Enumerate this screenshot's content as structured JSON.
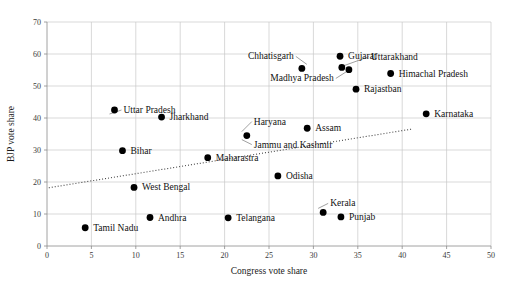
{
  "chart_data": {
    "type": "scatter",
    "title": "",
    "xlabel": "Congress vote share",
    "ylabel": "BJP vote share",
    "xlim": [
      0,
      50
    ],
    "ylim": [
      0,
      70
    ],
    "xticks": [
      0,
      5,
      10,
      15,
      20,
      25,
      30,
      35,
      40,
      45,
      50
    ],
    "yticks": [
      0,
      10,
      20,
      30,
      40,
      50,
      60,
      70
    ],
    "grid": true,
    "legend": "none",
    "marker_color": "#000000",
    "trendline": {
      "visible": true,
      "style": "dotted",
      "x_start": 0.2,
      "y_start": 18.2,
      "x_end": 41.0,
      "y_end": 36.5
    },
    "points": [
      {
        "label": "Uttar Pradesh",
        "x": 7.6,
        "y": 42.5,
        "label_dx": 9,
        "label_dy": 3,
        "leader": true
      },
      {
        "label": "Jharkhand",
        "x": 12.9,
        "y": 40.3,
        "label_dx": 8,
        "label_dy": 3,
        "leader": false
      },
      {
        "label": "Chhatisgarh",
        "x": 28.7,
        "y": 55.5,
        "label_dx": -8,
        "label_dy": -9,
        "leader": true
      },
      {
        "label": "Gujarat",
        "x": 33.0,
        "y": 59.3,
        "label_dx": 8,
        "label_dy": 3,
        "leader": false
      },
      {
        "label": "Uttarakhand",
        "x": 34.0,
        "y": 55.1,
        "label_dx": 22,
        "label_dy": -10,
        "leader": true
      },
      {
        "label": "Madhya Pradesh",
        "x": 33.2,
        "y": 55.8,
        "label_dx": -8,
        "label_dy": 14,
        "leader": true
      },
      {
        "label": "Himachal Pradesh",
        "x": 38.7,
        "y": 53.9,
        "label_dx": 8,
        "label_dy": 3,
        "leader": false
      },
      {
        "label": "Rajastban",
        "x": 34.8,
        "y": 49.0,
        "label_dx": 8,
        "label_dy": 3,
        "leader": false
      },
      {
        "label": "Karnataka",
        "x": 42.7,
        "y": 41.3,
        "label_dx": 8,
        "label_dy": 3,
        "leader": false
      },
      {
        "label": "Haryana",
        "x": 22.5,
        "y": 34.5,
        "label_dx": 7,
        "label_dy": -11,
        "leader": true
      },
      {
        "label": "Jammu and Kashmir",
        "x": 22.5,
        "y": 34.5,
        "label_dx": 7,
        "label_dy": 12,
        "leader": true
      },
      {
        "label": "Assam",
        "x": 29.3,
        "y": 36.8,
        "label_dx": 8,
        "label_dy": 3,
        "leader": false
      },
      {
        "label": "Bihar",
        "x": 8.5,
        "y": 29.8,
        "label_dx": 8,
        "label_dy": 3,
        "leader": false
      },
      {
        "label": "Maharastra",
        "x": 18.1,
        "y": 27.6,
        "label_dx": 8,
        "label_dy": 3,
        "leader": false
      },
      {
        "label": "Odisha",
        "x": 26.0,
        "y": 21.9,
        "label_dx": 8,
        "label_dy": 3,
        "leader": false
      },
      {
        "label": "West Bengal",
        "x": 9.8,
        "y": 18.3,
        "label_dx": 8,
        "label_dy": 3,
        "leader": false
      },
      {
        "label": "Andhra",
        "x": 11.6,
        "y": 8.9,
        "label_dx": 8,
        "label_dy": 3,
        "leader": false
      },
      {
        "label": "Telangana",
        "x": 20.4,
        "y": 8.8,
        "label_dx": 8,
        "label_dy": 3,
        "leader": false
      },
      {
        "label": "Kerala",
        "x": 31.1,
        "y": 10.5,
        "label_dx": 7,
        "label_dy": -6,
        "leader": true
      },
      {
        "label": "Punjab",
        "x": 33.1,
        "y": 9.1,
        "label_dx": 8,
        "label_dy": 3,
        "leader": false
      },
      {
        "label": "Tamil Nadu",
        "x": 4.3,
        "y": 5.7,
        "label_dx": 8,
        "label_dy": 3,
        "leader": false
      }
    ]
  }
}
